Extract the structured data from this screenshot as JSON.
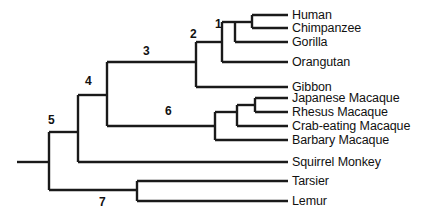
{
  "figure": {
    "kind": "phylogenetic-tree",
    "orientation": "left-to-right-rectangular-cladogram",
    "background_color": "#ffffff",
    "line_color": "#1a1a1a"
  },
  "taxa": [
    {
      "id": "human",
      "label": "Human",
      "tip_y": 15,
      "label_x": 292,
      "label_y": 9
    },
    {
      "id": "chimpanzee",
      "label": "Chimpanzee",
      "tip_y": 28,
      "label_x": 292,
      "label_y": 22
    },
    {
      "id": "gorilla",
      "label": "Gorilla",
      "tip_y": 42,
      "label_x": 292,
      "label_y": 36
    },
    {
      "id": "orangutan",
      "label": "Orangutan",
      "tip_y": 62,
      "label_x": 292,
      "label_y": 56
    },
    {
      "id": "gibbon",
      "label": "Gibbon",
      "tip_y": 87,
      "label_x": 292,
      "label_y": 81
    },
    {
      "id": "japanese-macaque",
      "label": "Japanese Macaque",
      "tip_y": 98,
      "label_x": 292,
      "label_y": 92
    },
    {
      "id": "rhesus-macaque",
      "label": "Rhesus Macaque",
      "tip_y": 112,
      "label_x": 292,
      "label_y": 106
    },
    {
      "id": "crab-eating-macaque",
      "label": "Crab-eating Macaque",
      "tip_y": 126,
      "label_x": 292,
      "label_y": 120
    },
    {
      "id": "barbary-macaque",
      "label": "Barbary Macaque",
      "tip_y": 140,
      "label_x": 292,
      "label_y": 134
    },
    {
      "id": "squirrel-monkey",
      "label": "Squirrel Monkey",
      "tip_y": 162,
      "label_x": 292,
      "label_y": 156
    },
    {
      "id": "tarsier",
      "label": "Tarsier",
      "tip_y": 181,
      "label_x": 292,
      "label_y": 175
    },
    {
      "id": "lemur",
      "label": "Lemur",
      "tip_y": 201,
      "label_x": 292,
      "label_y": 195
    }
  ],
  "node_numbers": [
    {
      "id": "node-1",
      "label": "1",
      "x": 215,
      "y": 18
    },
    {
      "id": "node-2",
      "label": "2",
      "x": 190,
      "y": 28
    },
    {
      "id": "node-3",
      "label": "3",
      "x": 143,
      "y": 45
    },
    {
      "id": "node-4",
      "label": "4",
      "x": 85,
      "y": 75
    },
    {
      "id": "node-5",
      "label": "5",
      "x": 48,
      "y": 114
    },
    {
      "id": "node-6",
      "label": "6",
      "x": 165,
      "y": 105
    },
    {
      "id": "node-7",
      "label": "7",
      "x": 99,
      "y": 196
    }
  ],
  "branch_paths": {
    "root_stub": "M 17,162 L 49,162",
    "node5_vertical": "M 49,132 L 49,190",
    "node5_to_node4": "M 49,132 L 78,132",
    "node5_to_node7_stem": "M 49,190 L 137,190",
    "node7_vertical": "M 137,181 L 137,201",
    "node7_to_tarsier": "M 137,181 L 288,181",
    "node7_to_lemur": "M 137,201 L 288,201",
    "node4_vertical": "M 78,95 L 78,162",
    "node4_to_node3": "M 78,95 L 107,95",
    "node4_to_squirrel": "M 78,162 L 288,162",
    "node3_vertical": "M 107,62 L 107,126",
    "node3_to_node2": "M 107,62 L 196,62",
    "node3_to_node6": "M 107,126 L 215,126",
    "node2_vertical": "M 196,42 L 196,87",
    "node2_to_node1": "M 196,42 L 222,42",
    "node2_to_gibbon": "M 196,87 L 288,87",
    "node1_vertical": "M 222,22 L 222,62",
    "node1_to_hcnode": "M 222,22 L 252,22",
    "node1_to_orangutan": "M 222,62 L 288,62",
    "hc_vertical": "M 252,15 L 252,28",
    "hc_to_human": "M 252,15 L 288,15",
    "hc_to_chimpanzee": "M 252,28 L 288,28",
    "node1b_vertical": "M 235,22 L 235,42",
    "node1b_to_gorilla": "M 235,42 L 288,42",
    "node6_vertical": "M 215,112 L 215,140",
    "node6_to_macnode": "M 215,112 L 237,112",
    "node6_to_barbary": "M 215,140 L 288,140",
    "macnode_vertical": "M 237,105 L 237,126",
    "macnode_to_jrnode": "M 237,105 L 255,105",
    "macnode_to_crab": "M 237,126 L 288,126",
    "jrnode_vertical": "M 255,98 L 255,112",
    "jrnode_to_japanese": "M 255,98 L 288,98",
    "jrnode_to_rhesus": "M 255,112 L 288,112"
  }
}
